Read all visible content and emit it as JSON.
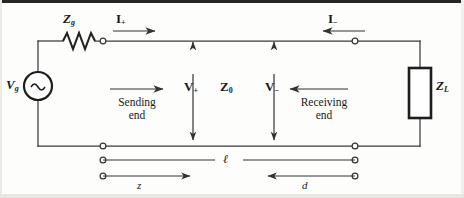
{
  "figure": {
    "background_color": "#fdfdfc",
    "line_color": "#3a3a3a"
  },
  "source": {
    "label": "V",
    "subscript": "g",
    "symbol_name": "ac-voltage-source",
    "glyph": "∼"
  },
  "generator_impedance": {
    "label": "Z",
    "subscript": "g",
    "symbol_name": "resistor-zigzag"
  },
  "load_impedance": {
    "label": "Z",
    "subscript": "L",
    "symbol_name": "impedance-box"
  },
  "line_impedance": {
    "label": "Z",
    "subscript": "0"
  },
  "currents": [
    {
      "name": "incident-current",
      "label": "I",
      "subscript": "+",
      "direction": "right"
    },
    {
      "name": "reflected-current",
      "label": "I",
      "subscript": "−",
      "direction": "left"
    }
  ],
  "voltages": [
    {
      "name": "incident-voltage",
      "label": "V",
      "subscript": "+"
    },
    {
      "name": "reflected-voltage",
      "label": "V",
      "subscript": "−"
    }
  ],
  "ends": {
    "sending": {
      "line1": "Sending",
      "line2": "end",
      "arrow": "right"
    },
    "receiving": {
      "line1": "Receiving",
      "line2": "end",
      "arrow": "left"
    }
  },
  "dimensions": [
    {
      "name": "line-length",
      "label": "ℓ",
      "style": "span"
    },
    {
      "name": "distance-from-source",
      "label": "z",
      "direction": "right"
    },
    {
      "name": "distance-from-load",
      "label": "d",
      "direction": "left"
    }
  ]
}
